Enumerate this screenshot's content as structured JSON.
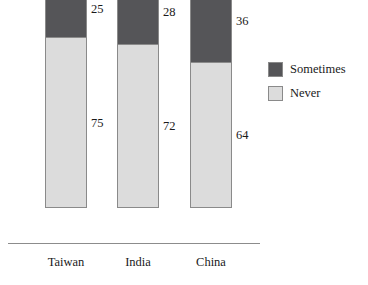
{
  "chart_data": {
    "type": "bar",
    "title": "",
    "subtitle": "",
    "xlabel": "",
    "ylabel": "",
    "stacked": true,
    "stack_total": 100,
    "ylim": [
      0,
      100
    ],
    "grid": false,
    "legend_position": "right",
    "categories": [
      "Taiwan",
      "India",
      "China"
    ],
    "series": [
      {
        "name": "Sometimes",
        "color": "#555558",
        "values": [
          25,
          28,
          36
        ]
      },
      {
        "name": "Never",
        "color": "#dcdcdc",
        "values": [
          75,
          72,
          64
        ]
      }
    ],
    "data_labels": {
      "Taiwan": {
        "Sometimes": "25",
        "Never": "75"
      },
      "India": {
        "Sometimes": "28",
        "Never": "72"
      },
      "China": {
        "Sometimes": "36",
        "Never": "64"
      }
    }
  },
  "colors": {
    "sometimes": "#555558",
    "never": "#dcdcdc",
    "border": "#8a8a8a",
    "axis": "#8c8c8c",
    "text": "#1a1a1a",
    "background": "#ffffff"
  },
  "bars": [
    {
      "category": "Taiwan",
      "top_label": "25",
      "bottom_label": "75",
      "top_value": 25,
      "bottom_value": 75
    },
    {
      "category": "India",
      "top_label": "28",
      "bottom_label": "72",
      "top_value": 28,
      "bottom_value": 72
    },
    {
      "category": "China",
      "top_label": "36",
      "bottom_label": "64",
      "top_value": 36,
      "bottom_value": 64
    }
  ],
  "legend": {
    "items": [
      {
        "label": "Sometimes",
        "swatch": "#555558"
      },
      {
        "label": "Never",
        "swatch": "#dcdcdc"
      }
    ]
  }
}
